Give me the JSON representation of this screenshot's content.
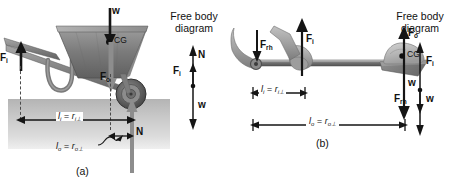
{
  "figure": {
    "panel_a": {
      "label": "(a)",
      "device": "wheelbarrow",
      "forces": [
        {
          "name": "w",
          "label": "w",
          "sub": "",
          "direction": "down",
          "point": "center-of-gravity"
        },
        {
          "name": "Fi",
          "label": "F",
          "sub": "i",
          "direction": "up",
          "point": "handles"
        },
        {
          "name": "Fo",
          "label": "F",
          "sub": "o",
          "direction": "down",
          "point": "load-line"
        },
        {
          "name": "N",
          "label": "N",
          "sub": "",
          "direction": "up",
          "point": "wheel-axle"
        }
      ],
      "cg_label": "CG",
      "distance_input": {
        "l": "l",
        "l_sub": "i",
        "eq": "=",
        "r": "r",
        "r_sub": "i⊥"
      },
      "distance_output": {
        "l": "l",
        "l_sub": "o",
        "eq": "=",
        "r": "r",
        "r_sub": "o⊥"
      },
      "fbd": {
        "title_line1": "Free body",
        "title_line2": "diagram",
        "labels": [
          {
            "name": "N",
            "label": "N",
            "sub": "",
            "direction": "up"
          },
          {
            "name": "Fi",
            "label": "F",
            "sub": "i",
            "direction": "up"
          },
          {
            "name": "w",
            "label": "w",
            "sub": "",
            "direction": "down"
          }
        ]
      }
    },
    "panel_b": {
      "label": "(b)",
      "device": "shovel",
      "forces": [
        {
          "name": "Frh",
          "label": "F",
          "sub": "rh",
          "direction": "down",
          "point": "rear-hand"
        },
        {
          "name": "Fi",
          "label": "F",
          "sub": "i",
          "direction": "up",
          "point": "front-hand"
        },
        {
          "name": "Fo",
          "label": "F",
          "sub": "o",
          "direction": "up",
          "point": "load"
        },
        {
          "name": "w",
          "label": "w",
          "sub": "",
          "direction": "down",
          "point": "center-of-gravity"
        }
      ],
      "cg_label": "CG",
      "distance_input": {
        "l": "l",
        "l_sub": "i",
        "eq": "=",
        "r": "r",
        "r_sub": "i⊥"
      },
      "distance_output": {
        "l": "l",
        "l_sub": "o",
        "eq": "=",
        "r": "r",
        "r_sub": "o⊥"
      },
      "fbd": {
        "title_line1": "Free body",
        "title_line2": "diagram",
        "labels": [
          {
            "name": "Fi",
            "label": "F",
            "sub": "i",
            "direction": "up"
          },
          {
            "name": "Frh",
            "label": "F",
            "sub": "rh",
            "direction": "down"
          },
          {
            "name": "w",
            "label": "w",
            "sub": "",
            "direction": "down"
          }
        ]
      }
    }
  },
  "colors": {
    "ink": "#111111",
    "arrow": "#1a1a1a",
    "ground_top": "#b4b4b4",
    "ground_bottom": "#efefef",
    "metal_dark": "#5e5e5e",
    "metal_mid": "#8a8a8a",
    "metal_light": "#b0b0b0",
    "rock": "#bdbdbd",
    "tire": "#4a4a4a"
  },
  "text": {
    "a_Fi": "F",
    "a_Fi_sub": "i",
    "a_Fo": "F",
    "a_Fo_sub": "o",
    "a_w": "w",
    "a_N": "N",
    "a_CG": "CG",
    "a_fbd_N": "N",
    "a_fbd_Fi": "F",
    "a_fbd_Fi_sub": "i",
    "a_fbd_w": "w",
    "b_Frh": "F",
    "b_Frh_sub": "rh",
    "b_Fi": "F",
    "b_Fi_sub": "i",
    "b_Fo": "F",
    "b_Fo_sub": "o",
    "b_w": "w",
    "b_CG": "CG",
    "b_fbd_Fi": "F",
    "b_fbd_Fi_sub": "i",
    "b_fbd_Frh": "F",
    "b_fbd_Frh_sub": "rh",
    "b_fbd_w": "w"
  }
}
